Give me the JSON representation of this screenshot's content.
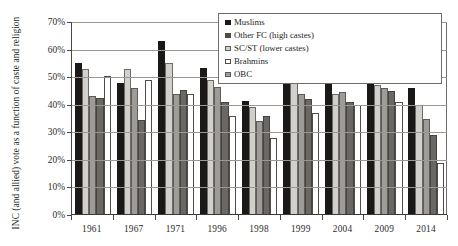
{
  "chart_data": {
    "type": "bar",
    "title": "",
    "xlabel": "",
    "ylabel": "INC (and allied) vote as a function of caste and religion",
    "ylim": [
      0,
      70
    ],
    "ytick_labels": [
      "0%",
      "10%",
      "20%",
      "30%",
      "40%",
      "50%",
      "60%",
      "70%"
    ],
    "ytick_values": [
      0,
      10,
      20,
      30,
      40,
      50,
      60,
      70
    ],
    "grid": true,
    "legend_position": "top-right",
    "categories": [
      "1961",
      "1967",
      "1971",
      "1996",
      "1998",
      "1999",
      "2004",
      "2009",
      "2014"
    ],
    "series": [
      {
        "name": "Muslims",
        "color": "#1b1917",
        "values": [
          55,
          48,
          63,
          53.5,
          41.5,
          52,
          49.5,
          48,
          46
        ]
      },
      {
        "name": "SC/ST (lower castes)",
        "color": "#d2d0cc",
        "values": [
          53,
          53,
          55,
          49,
          39,
          48,
          44,
          47,
          40
        ]
      },
      {
        "name": "OBC",
        "color": "#9e9c98",
        "values": [
          43,
          46,
          44,
          46.5,
          34,
          44,
          44.5,
          46,
          35
        ]
      },
      {
        "name": "Other FC (high castes)",
        "color": "#6a6764",
        "values": [
          42.5,
          34.5,
          45.5,
          41,
          36,
          42,
          41,
          45,
          29
        ]
      },
      {
        "name": "Brahmins",
        "color": "#ffffff",
        "values": [
          50.5,
          49,
          44,
          36,
          28,
          37,
          40,
          41,
          19
        ]
      }
    ]
  },
  "legend": {
    "items": [
      {
        "label": "Muslims",
        "key": "muslims"
      },
      {
        "label": "Other FC (high castes)",
        "key": "otherfc"
      },
      {
        "label": "SC/ST (lower castes)",
        "key": "scst"
      },
      {
        "label": "Brahmins",
        "key": "brahmins"
      },
      {
        "label": "OBC",
        "key": "obc"
      }
    ]
  }
}
